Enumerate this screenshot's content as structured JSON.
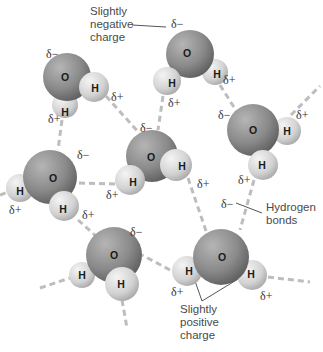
{
  "labels": {
    "slightly_negative": "Slightly\nnegative\ncharge",
    "hydrogen_bonds": "Hydrogen\nbonds",
    "slightly_positive": "Slightly\npositive\ncharge"
  },
  "symbols": {
    "oxygen": "O",
    "hydrogen": "H",
    "delta_minus": "δ−",
    "delta_plus": "δ+"
  },
  "colors": {
    "oxygen": "#8a8a8a",
    "hydrogen": "#d8d8d8",
    "bond": "#bdbdbd",
    "leader": "#555555"
  },
  "molecules": [
    {
      "id": "m1",
      "o": [
        67,
        77
      ],
      "h": [
        [
          94,
          87
        ],
        [
          65,
          105
        ]
      ]
    },
    {
      "id": "m2",
      "o": [
        190,
        54
      ],
      "h": [
        [
          167,
          81
        ],
        [
          215,
          72
        ]
      ]
    },
    {
      "id": "m3",
      "o": [
        253,
        130
      ],
      "h": [
        [
          287,
          131
        ],
        [
          263,
          165
        ]
      ]
    },
    {
      "id": "m4",
      "o": [
        50,
        177
      ],
      "h": [
        [
          20,
          188
        ],
        [
          64,
          206
        ]
      ]
    },
    {
      "id": "m5",
      "o": [
        152,
        156
      ],
      "h": [
        [
          176,
          165
        ],
        [
          130,
          180
        ]
      ]
    },
    {
      "id": "m6",
      "o": [
        221,
        257
      ],
      "h": [
        [
          187,
          271
        ],
        [
          252,
          275
        ]
      ]
    },
    {
      "id": "m7",
      "o": [
        114,
        255
      ],
      "h": [
        [
          82,
          275
        ],
        [
          122,
          284
        ]
      ]
    }
  ]
}
